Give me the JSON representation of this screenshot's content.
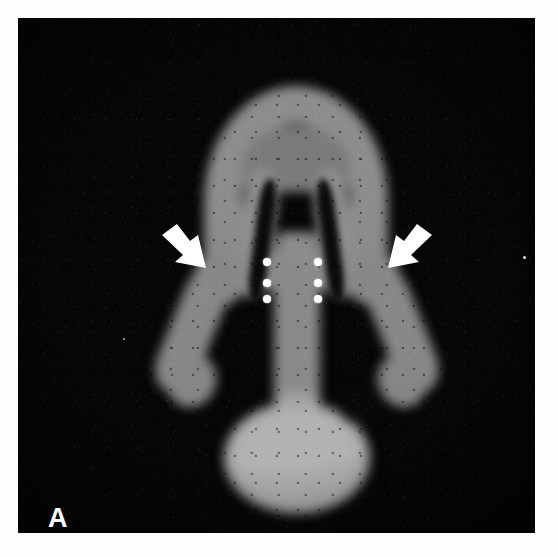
{
  "figure": {
    "kind": "nuclear-medicine-scintigraphy-image",
    "panel_label": "A",
    "modality_note": "planar radionuclide scan, grayscale, posterior view",
    "background_color": "#060606",
    "uptake_color_mid": "#8a8a8a",
    "uptake_color_hot": "#b2b2b2",
    "annotation_color": "#ffffff"
  },
  "annotations": {
    "arrows": [
      {
        "name": "left-arrow",
        "label": "",
        "direction": "down-right",
        "points_to": "left parenchymal margin / upper lateral region",
        "x": 142,
        "y": 206,
        "width": 58,
        "height": 46
      },
      {
        "name": "right-arrow",
        "label": "",
        "direction": "down-left",
        "points_to": "right parenchymal margin / upper lateral region",
        "x": 358,
        "y": 206,
        "width": 58,
        "height": 46
      }
    ],
    "marker_dots": {
      "count": 6,
      "arrangement": "two vertical columns of three",
      "diameter_px": 8,
      "left_column_x": 245,
      "right_column_x": 296,
      "rows_y": [
        240,
        261,
        277
      ]
    },
    "specks": [
      {
        "name": "film-speck-right",
        "x": 505,
        "y": 238
      },
      {
        "name": "film-speck-left",
        "x": 105,
        "y": 320
      }
    ]
  },
  "structures": [
    {
      "name": "superior-arch",
      "description": "bright inverted-U arch at the top of the field"
    },
    {
      "name": "inner-descending-limb-left",
      "description": "left inner limb of the central V"
    },
    {
      "name": "inner-descending-limb-right",
      "description": "right inner limb of the central V"
    },
    {
      "name": "photopenic-cleft-left",
      "description": "dark vertical slit left of midline"
    },
    {
      "name": "photopenic-cleft-right",
      "description": "dark vertical slit right of midline"
    },
    {
      "name": "lateral-wing-left",
      "description": "left lateral lobe angling inferolaterally"
    },
    {
      "name": "lateral-wing-right",
      "description": "right lateral lobe angling inferolaterally"
    },
    {
      "name": "central-stem",
      "description": "vertical midline tract descending to the bulb"
    },
    {
      "name": "inferior-bulb",
      "description": "rounded intensely active structure at the bottom"
    }
  ]
}
